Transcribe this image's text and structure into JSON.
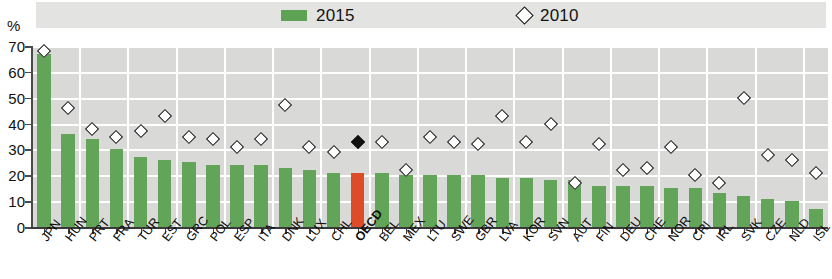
{
  "axis_title": "%",
  "legend": {
    "entries": [
      {
        "label": "2015",
        "marker": "green-square-swatch",
        "color": "#63a558"
      },
      {
        "label": "2010",
        "marker": "open-diamond-marker",
        "color": "#111111"
      }
    ]
  },
  "colors": {
    "bar_green": "#63a558",
    "bar_highlight": "#dd4b28",
    "plot_background": "#d9d9d7",
    "gridline": "#ffffff",
    "marker_outline": "#111111"
  },
  "chart_data": {
    "type": "bar",
    "title": "",
    "xlabel": "",
    "ylabel": "%",
    "ylim": [
      0,
      70
    ],
    "yticks": [
      0,
      10,
      20,
      30,
      40,
      50,
      60,
      70
    ],
    "grid": true,
    "legend_position": "top",
    "highlight_category": "OECD",
    "categories": [
      "JPN",
      "HUN",
      "PRT",
      "FRA",
      "TUR",
      "EST",
      "GRC",
      "POL",
      "ESP",
      "ITA",
      "DNK",
      "LUX",
      "CHL",
      "OECD",
      "BEL",
      "MEX",
      "LTU",
      "SWE",
      "GBR",
      "LVA",
      "KOR",
      "SVN",
      "AUT",
      "FIN",
      "DEU",
      "CHE",
      "NOR",
      "CRI",
      "IRL",
      "SVK",
      "CZE",
      "NLD",
      "ISL"
    ],
    "series": [
      {
        "name": "2015",
        "type": "bar",
        "values": [
          67,
          36,
          34,
          30,
          27,
          26,
          25,
          24,
          24,
          24,
          23,
          22,
          21,
          21,
          21,
          20,
          20,
          20,
          20,
          19,
          19,
          18,
          18,
          16,
          16,
          16,
          15,
          15,
          13,
          12,
          11,
          10,
          7
        ]
      },
      {
        "name": "2010",
        "type": "scatter",
        "values": [
          68,
          46,
          38,
          35,
          37,
          43,
          35,
          34,
          31,
          34,
          47,
          31,
          29,
          33,
          33,
          22,
          35,
          33,
          32,
          43,
          33,
          40,
          17,
          32,
          22,
          23,
          31,
          20,
          17,
          50,
          28,
          26,
          21
        ]
      }
    ]
  }
}
